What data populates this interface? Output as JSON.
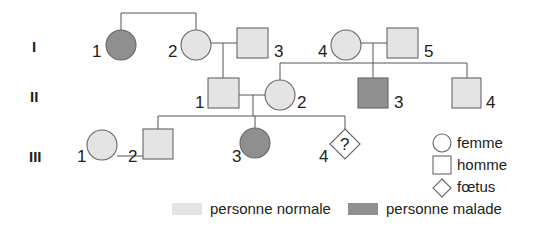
{
  "colors": {
    "normal": "#e4e4e4",
    "affected": "#8f8f8f",
    "line": "#555555",
    "text": "#222222"
  },
  "generations": [
    {
      "label": "I",
      "y": 52
    },
    {
      "label": "II",
      "y": 102
    },
    {
      "label": "III",
      "y": 162
    }
  ],
  "individuals": [
    {
      "id": "I-1",
      "label": "1",
      "sex": "female",
      "status": "affected"
    },
    {
      "id": "I-2",
      "label": "2",
      "sex": "female",
      "status": "normal"
    },
    {
      "id": "I-3",
      "label": "3",
      "sex": "male",
      "status": "normal"
    },
    {
      "id": "I-4",
      "label": "4",
      "sex": "female",
      "status": "normal"
    },
    {
      "id": "I-5",
      "label": "5",
      "sex": "male",
      "status": "normal"
    },
    {
      "id": "II-1",
      "label": "1",
      "sex": "male",
      "status": "normal"
    },
    {
      "id": "II-2",
      "label": "2",
      "sex": "female",
      "status": "normal"
    },
    {
      "id": "II-3",
      "label": "3",
      "sex": "male",
      "status": "affected"
    },
    {
      "id": "II-4",
      "label": "4",
      "sex": "male",
      "status": "normal"
    },
    {
      "id": "III-1",
      "label": "1",
      "sex": "female",
      "status": "normal"
    },
    {
      "id": "III-2",
      "label": "2",
      "sex": "male",
      "status": "normal"
    },
    {
      "id": "III-3",
      "label": "3",
      "sex": "female",
      "status": "affected"
    },
    {
      "id": "III-4",
      "label": "4",
      "sex": "fetus",
      "status": "unknown",
      "mark": "?"
    }
  ],
  "legend": {
    "female": "femme",
    "male": "homme",
    "fetus": "fœtus",
    "normal": "personne normale",
    "affected": "personne malade"
  }
}
